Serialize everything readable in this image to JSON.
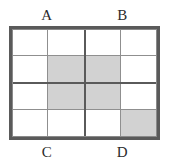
{
  "figure": {
    "name": "quadrant-grid-diagram",
    "labels": {
      "top": [
        "A",
        "B"
      ],
      "bottom": [
        "C",
        "D"
      ]
    },
    "colors": {
      "shaded_cell": "#d2d2d2",
      "empty_cell": "#ffffff",
      "outer_frame": "#5a5a5a",
      "major_divider": "#5a5a5a",
      "minor_divider": "#8f8f8f",
      "label_text": "#2b2b2b",
      "background": "#ffffff"
    },
    "grid": {
      "quadrant_rows": 2,
      "quadrant_columns": 2,
      "cells_per_quadrant_rows": 2,
      "cells_per_quadrant_columns": 2,
      "total_cells": 16,
      "shaded_count": 5
    },
    "quadrants": [
      {
        "id": "q-tl",
        "label": "A",
        "position": "top-left",
        "cells": [
          {
            "id": "c-tl",
            "position": "top-left",
            "shaded": false
          },
          {
            "id": "c-tr",
            "position": "top-right",
            "shaded": false
          },
          {
            "id": "c-bl",
            "position": "bottom-left",
            "shaded": false
          },
          {
            "id": "c-br",
            "position": "bottom-right",
            "shaded": true
          }
        ]
      },
      {
        "id": "q-tr",
        "label": "B",
        "position": "top-right",
        "cells": [
          {
            "id": "c-tl",
            "position": "top-left",
            "shaded": false
          },
          {
            "id": "c-tr",
            "position": "top-right",
            "shaded": false
          },
          {
            "id": "c-bl",
            "position": "bottom-left",
            "shaded": true
          },
          {
            "id": "c-br",
            "position": "bottom-right",
            "shaded": false
          }
        ]
      },
      {
        "id": "q-bl",
        "label": "C",
        "position": "bottom-left",
        "cells": [
          {
            "id": "c-tl",
            "position": "top-left",
            "shaded": false
          },
          {
            "id": "c-tr",
            "position": "top-right",
            "shaded": true
          },
          {
            "id": "c-bl",
            "position": "bottom-left",
            "shaded": false
          },
          {
            "id": "c-br",
            "position": "bottom-right",
            "shaded": false
          }
        ]
      },
      {
        "id": "q-br",
        "label": "D",
        "position": "bottom-right",
        "cells": [
          {
            "id": "c-tl",
            "position": "top-left",
            "shaded": true
          },
          {
            "id": "c-tr",
            "position": "top-right",
            "shaded": false
          },
          {
            "id": "c-bl",
            "position": "bottom-left",
            "shaded": false
          },
          {
            "id": "c-br",
            "position": "bottom-right",
            "shaded": true
          }
        ]
      }
    ]
  }
}
